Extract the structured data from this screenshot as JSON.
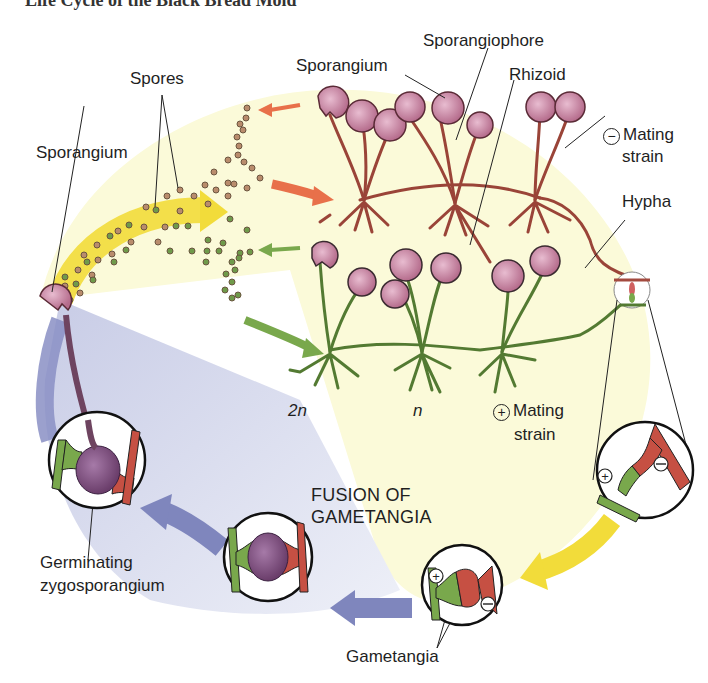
{
  "figure": {
    "cut_title": "Life Cycle of the Black Bread Mold",
    "colors": {
      "background": "#ffffff",
      "haploid_zone": "#fbfad9",
      "diploid_zone": "#d9dcef",
      "minus_strain": "#a34a3f",
      "plus_strain": "#5e8a3a",
      "sporangium": "#c07a95",
      "zygosporangium": "#7a4a78",
      "arrow_yellow": "#f2dc3a",
      "arrow_orange": "#e8704a",
      "arrow_green": "#79a84c",
      "arrow_blue": "#7f86bd",
      "text": "#1f1f1f"
    },
    "labels": {
      "sporangiophore": "Sporangiophore",
      "sporangium_top": "Sporangium",
      "rhizoid": "Rhizoid",
      "spores": "Spores",
      "sporangium_left": "Sporangium",
      "minus_symbol": "−",
      "mating_strain_minus_1": "Mating",
      "mating_strain_minus_2": "strain",
      "hypha": "Hypha",
      "ploidy_2n": "2n",
      "ploidy_n": "n",
      "plus_symbol": "+",
      "mating_strain_plus_1": "Mating",
      "mating_strain_plus_2": "strain",
      "fusion_1": "FUSION OF",
      "fusion_2": "GAMETANGIA",
      "germinating_1": "Germinating",
      "germinating_2": "zygosporangium",
      "gametangia": "Gametangia",
      "circle_plus": "+",
      "circle_minus": "−"
    }
  }
}
